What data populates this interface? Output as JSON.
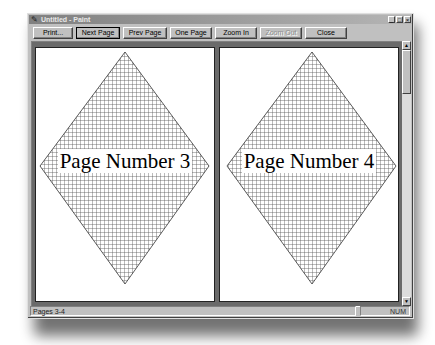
{
  "window": {
    "title": "Untitled - Paint",
    "app_icon": "paint-icon",
    "controls": {
      "minimize": "_",
      "maximize": "□",
      "close": "×"
    }
  },
  "toolbar": {
    "buttons": [
      {
        "label": "Print...",
        "enabled": true,
        "default": false
      },
      {
        "label": "Next Page",
        "enabled": true,
        "default": true
      },
      {
        "label": "Prev Page",
        "enabled": true,
        "default": false
      },
      {
        "label": "One Page",
        "enabled": true,
        "default": false
      },
      {
        "label": "Zoom In",
        "enabled": true,
        "default": false
      },
      {
        "label": "Zoom Out",
        "enabled": false,
        "default": false
      },
      {
        "label": "Close",
        "enabled": true,
        "default": false
      }
    ]
  },
  "preview": {
    "pages": [
      {
        "label": "Page Number 3"
      },
      {
        "label": "Page Number 4"
      }
    ],
    "shape": "crosshatched-diamond",
    "colors": {
      "background": "#6a6a6a",
      "page": "#ffffff",
      "hatch": "#444444"
    }
  },
  "scrollbar": {
    "up_arrow": "▲",
    "down_arrow": "▼"
  },
  "statusbar": {
    "pages": "Pages 3-4",
    "num_lock": "NUM"
  }
}
